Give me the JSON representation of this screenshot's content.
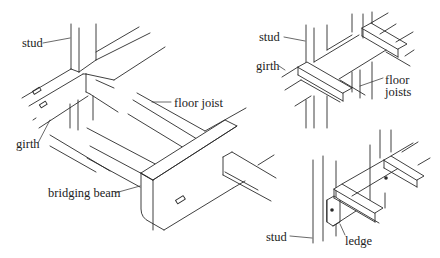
{
  "diagram": {
    "background": "#ffffff",
    "line_color": "#2a2a2a",
    "panels": [
      {
        "id": "main",
        "labels": {
          "stud": "stud",
          "girth": "girth",
          "floor_joist": "floor joist",
          "bridging_beam": "bridging beam"
        }
      },
      {
        "id": "top-right",
        "labels": {
          "stud": "stud",
          "girth": "girth",
          "floor_joists_line1": "floor",
          "floor_joists_line2": "joists"
        }
      },
      {
        "id": "bottom-right",
        "labels": {
          "stud": "stud",
          "ledge": "ledge"
        }
      }
    ]
  }
}
